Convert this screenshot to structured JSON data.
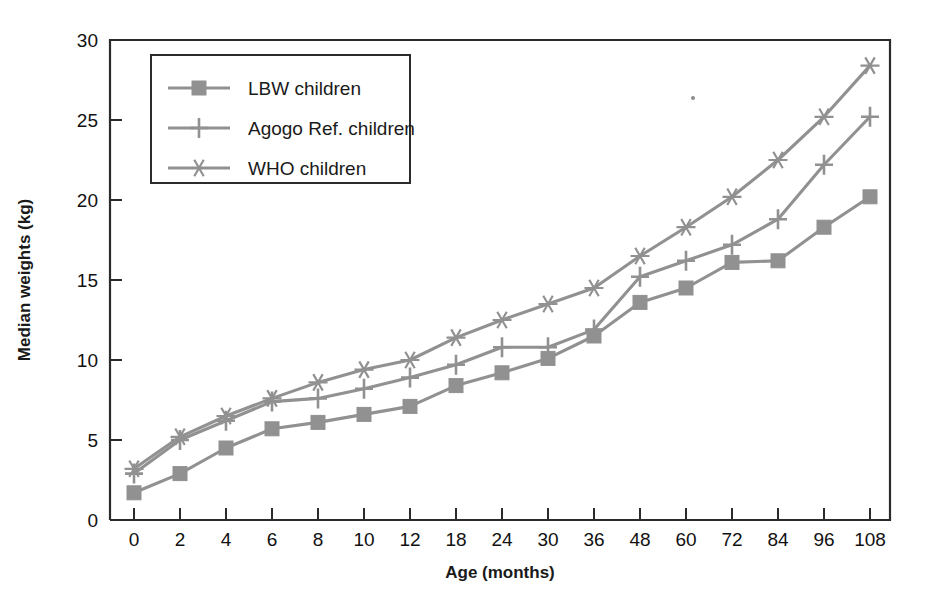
{
  "chart_data": {
    "type": "line",
    "title": "",
    "xlabel": "Age (months)",
    "ylabel": "Median weights (kg)",
    "categories": [
      "0",
      "2",
      "4",
      "6",
      "8",
      "10",
      "12",
      "18",
      "24",
      "30",
      "36",
      "48",
      "60",
      "72",
      "84",
      "96",
      "108"
    ],
    "x_tick_labels": [
      "0",
      "2",
      "4",
      "6",
      "8",
      "10",
      "12",
      "18",
      "24",
      "30",
      "36",
      "48",
      "60",
      "72",
      "84",
      "96",
      "108"
    ],
    "y_tick_labels": [
      "0",
      "5",
      "10",
      "15",
      "20",
      "25",
      "30"
    ],
    "y_ticks": [
      0,
      5,
      10,
      15,
      20,
      25,
      30
    ],
    "ylim": [
      0,
      30
    ],
    "grid": false,
    "legend_position": "upper-left-inside",
    "axis_scale_note": "x axis is categorical with evenly spaced age groups",
    "series": [
      {
        "name": "LBW children",
        "marker": "square",
        "color": "#919191",
        "values": [
          1.7,
          2.9,
          4.5,
          5.7,
          6.1,
          6.6,
          7.1,
          8.4,
          9.2,
          10.1,
          11.5,
          13.6,
          14.5,
          16.1,
          16.2,
          18.3,
          20.2
        ]
      },
      {
        "name": "Agogo Ref. children",
        "marker": "plus",
        "color": "#919191",
        "values": [
          2.9,
          5.0,
          6.2,
          7.4,
          7.6,
          8.2,
          8.9,
          9.7,
          10.8,
          10.8,
          11.9,
          15.2,
          16.2,
          17.2,
          18.8,
          22.2,
          25.2
        ]
      },
      {
        "name": "WHO children",
        "marker": "asterisk",
        "color": "#919191",
        "values": [
          3.2,
          5.2,
          6.5,
          7.6,
          8.6,
          9.4,
          10.0,
          11.4,
          12.5,
          13.5,
          14.5,
          16.5,
          18.3,
          20.2,
          22.5,
          25.2,
          28.4
        ]
      }
    ],
    "legend_entries": [
      "LBW children",
      "Agogo Ref. children",
      "WHO children"
    ]
  },
  "colors": {
    "series_gray": "#919191",
    "axis_black": "#2b2b2b",
    "text": "#1a1a1a",
    "background": "#ffffff"
  }
}
